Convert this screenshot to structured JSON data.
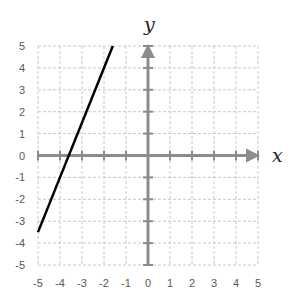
{
  "chart_data": {
    "type": "line",
    "title": "",
    "xlabel": "x",
    "ylabel": "y",
    "xlim": [
      -5,
      5
    ],
    "ylim": [
      -5,
      5
    ],
    "grid": true,
    "x_ticks": [
      -5,
      -4,
      -3,
      -2,
      -1,
      0,
      1,
      2,
      3,
      4,
      5
    ],
    "y_ticks": [
      -5,
      -4,
      -3,
      -2,
      -1,
      0,
      1,
      2,
      3,
      4,
      5
    ],
    "x_tick_labels": [
      "-5",
      "-4",
      "-3",
      "-2",
      "-1",
      "0",
      "1",
      "2",
      "3",
      "4",
      "5"
    ],
    "y_tick_labels": [
      "-5",
      "-4",
      "-3",
      "-2",
      "-1",
      "0",
      "1",
      "2",
      "3",
      "4",
      "5"
    ],
    "series": [
      {
        "name": "line",
        "equation": "y = 2.5x + 9",
        "x": [
          -5,
          -1.6
        ],
        "y": [
          -3.5,
          5
        ],
        "color": "#000000"
      }
    ],
    "colors": {
      "grid": "#c8c8c8",
      "axis": "#8c8c8c",
      "line": "#000000"
    }
  }
}
